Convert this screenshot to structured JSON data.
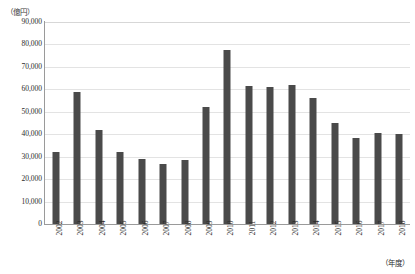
{
  "chart_data": {
    "type": "bar",
    "title": "",
    "xlabel": "（年度）",
    "ylabel": "（億円）",
    "ylim": [
      0,
      90000
    ],
    "ytick_step": 10000,
    "ytick_labels": [
      "90,000",
      "80,000",
      "70,000",
      "60,000",
      "50,000",
      "40,000",
      "30,000",
      "20,000",
      "10,000",
      "0"
    ],
    "ytick_values": [
      90000,
      80000,
      70000,
      60000,
      50000,
      40000,
      30000,
      20000,
      10000,
      0
    ],
    "grid": true,
    "legend": "none",
    "bar_color": "#4a4a4a",
    "categories": [
      "2002",
      "2003",
      "2004",
      "2005",
      "2006",
      "2007",
      "2008",
      "2009",
      "2010",
      "2011",
      "2012",
      "2013",
      "2014",
      "2015",
      "2016",
      "2017",
      "2018"
    ],
    "values": [
      32000,
      58800,
      42000,
      32000,
      29000,
      26800,
      28500,
      52000,
      77500,
      61500,
      61200,
      62000,
      56000,
      45000,
      38500,
      40500,
      40300
    ]
  },
  "axes": {
    "y_unit_label": "（億円）",
    "x_unit_label": "（年度）"
  }
}
